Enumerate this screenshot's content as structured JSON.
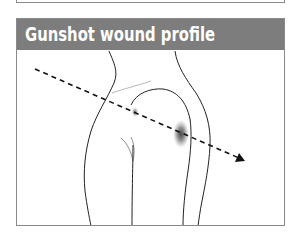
{
  "figure": {
    "title": "Gunshot wound profile",
    "header_color": "#7d7d7d",
    "title_color": "#ffffff",
    "illustration": {
      "subject": "side profile of hip/buttock",
      "trajectory": "dashed-arrow",
      "entry_wound": "small-mark",
      "exit_wound": "bruise"
    }
  }
}
